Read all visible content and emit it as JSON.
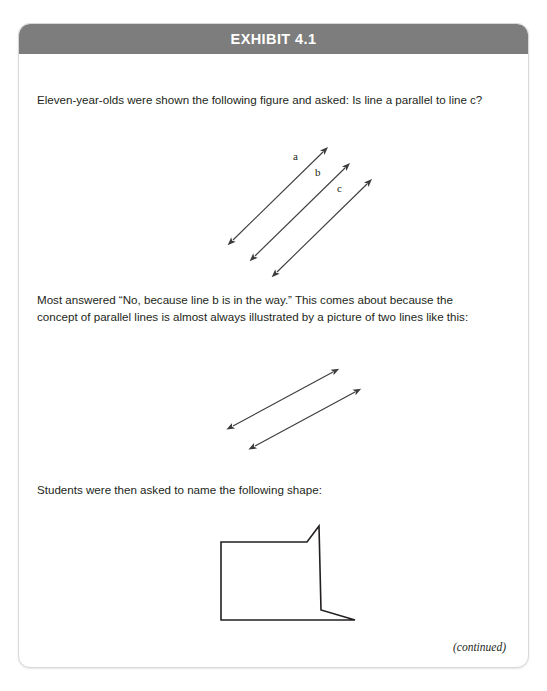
{
  "exhibit": {
    "header": {
      "title": "EXHIBIT 4.1"
    },
    "paragraphs": {
      "question": "Eleven-year-olds were shown the following figure and asked: Is line a parallel to line c?",
      "answer": "Most answered “No, because line b is in the way.” This comes about because the concept of parallel lines is almost always illustrated by a picture of two lines like this:",
      "shape_prompt": "Students were then asked to name the following shape:"
    },
    "figures": {
      "three_lines": {
        "name": "three-parallel-lines-diagram",
        "labels": [
          {
            "text": "a",
            "x": 78,
            "y": 18
          },
          {
            "text": "b",
            "x": 100,
            "y": 34
          },
          {
            "text": "c",
            "x": 122,
            "y": 50
          }
        ],
        "lines": [
          {
            "x1": 18,
            "y1": 98,
            "x2": 108,
            "y2": 10
          },
          {
            "x1": 40,
            "y1": 114,
            "x2": 130,
            "y2": 26
          },
          {
            "x1": 62,
            "y1": 130,
            "x2": 152,
            "y2": 42
          }
        ],
        "arrow_style": "double-headed",
        "stroke": "#3c3c3c"
      },
      "two_lines": {
        "name": "two-parallel-lines-diagram",
        "lines": [
          {
            "x1": 18,
            "y1": 62,
            "x2": 118,
            "y2": 8
          },
          {
            "x1": 40,
            "y1": 82,
            "x2": 140,
            "y2": 28
          }
        ],
        "arrow_style": "double-headed",
        "stroke": "#3c3c3c"
      },
      "shape": {
        "name": "irregular-quadrilateral-shape",
        "points": "6,18 92,18 104,2 106,86 140,96 6,96",
        "stroke": "#231f20",
        "fill": "none"
      }
    },
    "continued_note": "(continued)"
  }
}
